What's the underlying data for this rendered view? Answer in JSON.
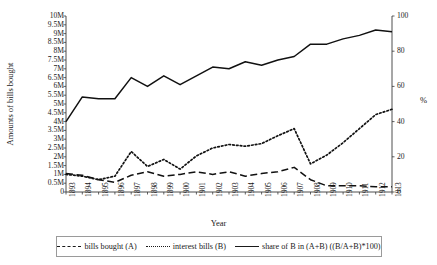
{
  "chart_data": {
    "type": "line",
    "title": "",
    "xlabel": "Year",
    "ylabel": "Amounts of bills bought",
    "y2label": "%",
    "grid": false,
    "legend_position": "bottom",
    "x": [
      1893,
      1894,
      1895,
      1896,
      1897,
      1898,
      1899,
      1900,
      1901,
      1902,
      1903,
      1904,
      1905,
      1906,
      1907,
      1908,
      1909,
      1910,
      1911,
      1912,
      1913
    ],
    "xtick_labels": [
      "1893",
      "1894",
      "1895",
      "1896",
      "1897",
      "1898",
      "1899",
      "1900",
      "1901",
      "1902",
      "1903",
      "1904",
      "1905",
      "1906",
      "1907",
      "1908",
      "1909",
      "1910",
      "1911",
      "1912",
      "1913"
    ],
    "ylim": [
      0,
      10000000
    ],
    "ytick_labels": [
      "0",
      "0.5M",
      "1M",
      "1.5M",
      "2M",
      "2.5M",
      "3M",
      "3.5M",
      "4M",
      "4.5M",
      "5M",
      "5.5M",
      "6M",
      "6.5M",
      "7M",
      "7.5M",
      "8M",
      "8.5M",
      "9M",
      "9.5M",
      "10M"
    ],
    "ytick_values": [
      0,
      500000,
      1000000,
      1500000,
      2000000,
      2500000,
      3000000,
      3500000,
      4000000,
      4500000,
      5000000,
      5500000,
      6000000,
      6500000,
      7000000,
      7500000,
      8000000,
      8500000,
      9000000,
      9500000,
      10000000
    ],
    "y2lim": [
      0,
      100
    ],
    "y2tick_labels": [
      "0",
      "20",
      "40",
      "60",
      "80",
      "100"
    ],
    "y2tick_values": [
      0,
      20,
      40,
      60,
      80,
      100
    ],
    "series": [
      {
        "name": "bills bought (A)",
        "axis": "left",
        "style": "dashed",
        "values": [
          1050000,
          950000,
          700000,
          550000,
          950000,
          1150000,
          900000,
          1000000,
          1150000,
          1000000,
          1150000,
          900000,
          1050000,
          1150000,
          1400000,
          700000,
          350000,
          350000,
          350000,
          300000,
          300000
        ]
      },
      {
        "name": "interest bills (B)",
        "axis": "left",
        "style": "dotted",
        "values": [
          1000000,
          900000,
          700000,
          900000,
          2300000,
          1450000,
          1850000,
          1300000,
          2050000,
          2500000,
          2700000,
          2600000,
          2750000,
          3200000,
          3600000,
          1600000,
          2100000,
          2800000,
          3600000,
          4400000,
          4700000
        ]
      },
      {
        "name": "share of B in (A+B) ((B/A+B)*100)",
        "axis": "right",
        "style": "solid",
        "values": [
          40,
          54,
          53,
          53,
          65,
          60,
          66,
          61,
          66,
          71,
          70,
          74,
          72,
          75,
          77,
          84,
          84,
          87,
          89,
          92,
          91
        ]
      }
    ]
  },
  "legend": {
    "items": [
      {
        "label": "bills bought (A)",
        "style": "dashed"
      },
      {
        "label": "interest bills (B)",
        "style": "dotted"
      },
      {
        "label": "share of B in (A+B) ((B/A+B)*100)",
        "style": "solid"
      }
    ]
  }
}
